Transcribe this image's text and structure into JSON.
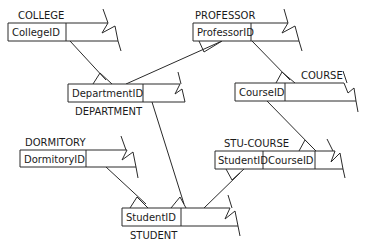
{
  "entities": {
    "college": {
      "name": "COLLEGE",
      "keys": [
        "CollegeID"
      ]
    },
    "professor": {
      "name": "PROFESSOR",
      "keys": [
        "ProfessorID"
      ]
    },
    "department": {
      "name": "DEPARTMENT",
      "keys": [
        "DepartmentID"
      ]
    },
    "course": {
      "name": "COURSE",
      "keys": [
        "CourseID"
      ]
    },
    "dormitory": {
      "name": "DORMITORY",
      "keys": [
        "DormitoryID"
      ]
    },
    "stu_course": {
      "name": "STU-COURSE",
      "keys": [
        "StudentID",
        "CourseID"
      ]
    },
    "student": {
      "name": "STUDENT",
      "keys": [
        "StudentID"
      ]
    }
  },
  "relationships": [
    {
      "from": "COLLEGE",
      "to": "DEPARTMENT",
      "type": "one-to-many"
    },
    {
      "from": "PROFESSOR",
      "to": "DEPARTMENT",
      "type": "many-to-one"
    },
    {
      "from": "PROFESSOR",
      "to": "COURSE",
      "type": "one-to-many"
    },
    {
      "from": "DEPARTMENT",
      "to": "STUDENT",
      "type": "one-to-many"
    },
    {
      "from": "DORMITORY",
      "to": "STUDENT",
      "type": "one-to-many"
    },
    {
      "from": "COURSE",
      "to": "STU-COURSE",
      "type": "one-to-many"
    },
    {
      "from": "STUDENT",
      "to": "STU-COURSE",
      "type": "one-to-many"
    }
  ]
}
